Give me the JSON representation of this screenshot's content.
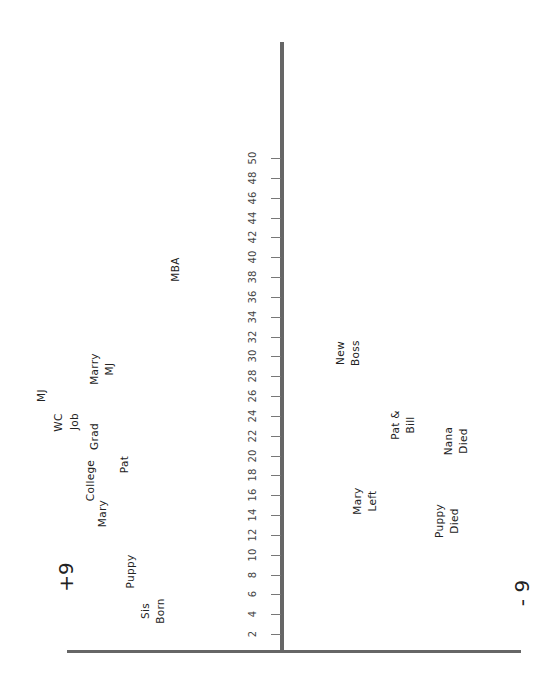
{
  "chart_data": {
    "type": "scatter",
    "title": "",
    "orientation": "rotated 90° counter-clockwise (age axis vertical, score axis horizontal)",
    "xlabel": "Age",
    "ylabel": "Impact (-9 to +9)",
    "x_ticks": [
      2,
      4,
      6,
      8,
      10,
      12,
      14,
      16,
      18,
      20,
      22,
      24,
      26,
      28,
      30,
      32,
      34,
      36,
      38,
      40,
      42,
      44,
      46,
      48,
      50
    ],
    "xlim": [
      0,
      52
    ],
    "ylim": [
      -9,
      9
    ],
    "pole_labels": {
      "positive": "+9",
      "negative": "- 9"
    },
    "grid": false,
    "points": [
      {
        "label": "Sis Born",
        "age": 5,
        "score": 4.3
      },
      {
        "label": "Puppy",
        "age": 9,
        "score": 5.2
      },
      {
        "label": "Mary",
        "age": 15,
        "score": 5.8
      },
      {
        "label": "College",
        "age": 18,
        "score": 6.3
      },
      {
        "label": "Pat",
        "age": 20,
        "score": 5.0
      },
      {
        "label": "Grad",
        "age": 22,
        "score": 6.1
      },
      {
        "label": "Job",
        "age": 24,
        "score": 7.0
      },
      {
        "label": "WC",
        "age": 25,
        "score": 7.6
      },
      {
        "label": "MJ",
        "age": 27,
        "score": 8.4
      },
      {
        "label": "Marry MJ",
        "age": 29,
        "score": 6.1
      },
      {
        "label": "MBA",
        "age": 37,
        "score": 3.5
      },
      {
        "label": "New Boss",
        "age": 30,
        "score": -2.0
      },
      {
        "label": "Pat & Bill",
        "age": 22,
        "score": -3.5
      },
      {
        "label": "Nana Died",
        "age": 20,
        "score": -5.0
      },
      {
        "label": "Mary Left",
        "age": 16,
        "score": -2.5
      },
      {
        "label": "Puppy Died",
        "age": 13,
        "score": -4.7
      }
    ]
  },
  "labels": {
    "ticks": [
      "2",
      "4",
      "6",
      "8",
      "10",
      "12",
      "14",
      "16",
      "18",
      "20",
      "22",
      "24",
      "26",
      "28",
      "30",
      "32",
      "34",
      "36",
      "38",
      "40",
      "42",
      "44",
      "46",
      "48",
      "50"
    ],
    "pos_pole": "+9",
    "neg_pole": "- 9",
    "events": {
      "sis_born": "Sis\nBorn",
      "puppy": "Puppy",
      "mary": "Mary",
      "college": "College",
      "pat": "Pat",
      "grad": "Grad",
      "job": "Job",
      "wc": "WC",
      "mj": "MJ",
      "marry_mj": "Marry\nMJ",
      "mba": "MBA",
      "new_boss": "New\nBoss",
      "pat_bill": "Pat &\nBill",
      "nana_died": "Nana\nDied",
      "mary_left": "Mary\nLeft",
      "puppy_died": "Puppy\nDied"
    }
  }
}
